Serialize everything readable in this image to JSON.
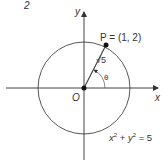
{
  "figure_number": "2",
  "axes": {
    "x_label": "x",
    "y_label": "y",
    "origin_label": "O"
  },
  "point": {
    "label": "P = (1, 2)",
    "x": 1,
    "y": 2
  },
  "segment_label": "√5",
  "angle_label": "θ",
  "circle": {
    "equation_x": "x",
    "equation_y": "y",
    "equation_rest": " = 5",
    "radius_squared": 5
  },
  "colors": {
    "line": "#333333",
    "text": "#333333",
    "background": "#ffffff"
  }
}
